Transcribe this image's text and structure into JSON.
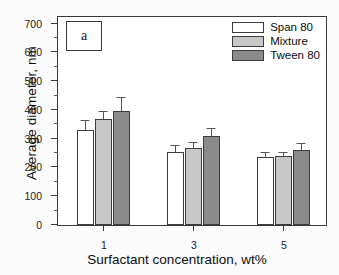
{
  "chart_data": {
    "type": "bar",
    "title": "",
    "panel_label": "a",
    "xlabel": "Surfactant concentration, wt%",
    "ylabel": "Average diameter, nm",
    "categories": [
      "1",
      "3",
      "5"
    ],
    "xtick_labels": [
      "1",
      "3",
      "5"
    ],
    "ytick_labels": [
      "0",
      "100",
      "200",
      "300",
      "400",
      "500",
      "600",
      "700"
    ],
    "ytick_values": [
      0,
      100,
      200,
      300,
      400,
      500,
      600,
      700
    ],
    "yminor_values": [
      50,
      150,
      250,
      350,
      450,
      550,
      650
    ],
    "ylim": [
      0,
      730
    ],
    "grid": false,
    "legend_position": "top-right",
    "series": [
      {
        "name": "Span 80",
        "color": "#ffffff",
        "values": [
          332,
          254,
          236
        ],
        "errors": [
          28,
          20,
          13
        ]
      },
      {
        "name": "Mixture",
        "color": "#c8c8c8",
        "values": [
          370,
          269,
          240
        ],
        "errors": [
          22,
          15,
          12
        ]
      },
      {
        "name": "Tween 80",
        "color": "#8a8a8a",
        "values": [
          396,
          310,
          260
        ],
        "errors": [
          45,
          25,
          20
        ]
      }
    ]
  }
}
